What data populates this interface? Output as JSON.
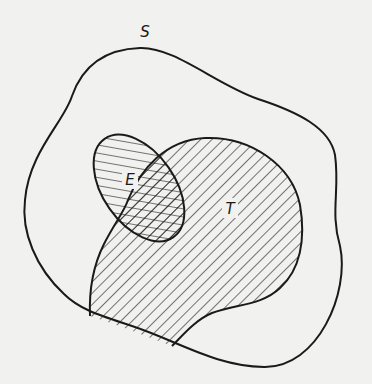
{
  "diagram": {
    "type": "venn-diagram",
    "sets": [
      {
        "id": "S",
        "label": "S",
        "role": "sample space / universal set",
        "fill": "none"
      },
      {
        "id": "E",
        "label": "E",
        "role": "event",
        "fill": "hatch-diagonal-down"
      },
      {
        "id": "T",
        "label": "T",
        "role": "event",
        "fill": "hatch-diagonal-up"
      }
    ],
    "regions": [
      {
        "id": "E-and-T",
        "fill": "crosshatch",
        "description": "intersection of E and T"
      }
    ],
    "colors": {
      "background": "#f1f1ef",
      "stroke": "#1a1a1a"
    }
  }
}
